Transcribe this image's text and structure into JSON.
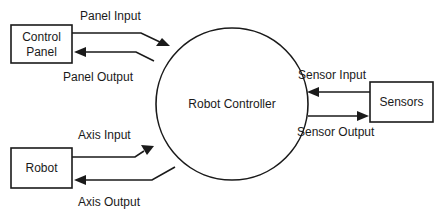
{
  "diagram": {
    "type": "context-diagram",
    "central_process": {
      "label": "Robot Controller"
    },
    "entities": {
      "control_panel": {
        "line1": "Control",
        "line2": "Panel"
      },
      "robot": {
        "label": "Robot"
      },
      "sensors": {
        "label": "Sensors"
      }
    },
    "flows": {
      "panel_input": {
        "label": "Panel Input",
        "from": "Control Panel",
        "to": "Robot Controller"
      },
      "panel_output": {
        "label": "Panel Output",
        "from": "Robot Controller",
        "to": "Control Panel"
      },
      "axis_input": {
        "label": "Axis Input",
        "from": "Robot",
        "to": "Robot Controller"
      },
      "axis_output": {
        "label": "Axis Output",
        "from": "Robot Controller",
        "to": "Robot"
      },
      "sensor_input": {
        "label": "Sensor Input",
        "from": "Sensors",
        "to": "Robot Controller"
      },
      "sensor_output": {
        "label": "Sensor Output",
        "from": "Robot Controller",
        "to": "Sensors"
      }
    },
    "colors": {
      "stroke": "#1a1a1a",
      "background": "#ffffff"
    }
  }
}
